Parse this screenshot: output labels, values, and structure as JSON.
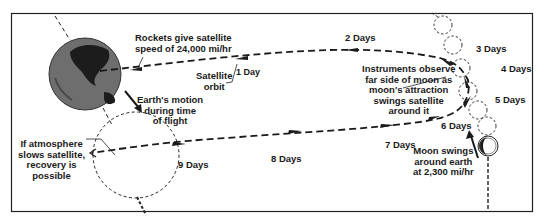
{
  "diagram": {
    "labels": {
      "rockets": [
        "Rockets give satellite",
        "speed of 24,000 mi/hr"
      ],
      "earth_motion": [
        "Earth's motion",
        "during time",
        "of flight"
      ],
      "satellite_orbit": [
        "Satellite",
        "orbit"
      ],
      "instruments": [
        "Instruments observe",
        "far side of moon as",
        "moon's attraction",
        "swings satellite",
        "around it"
      ],
      "atmosphere": [
        "If atmosphere",
        "slows satellite,",
        "recovery is",
        "possible"
      ],
      "moon_swings": [
        "Moon swings",
        "around earth",
        "at 2,300 mi/hr"
      ]
    },
    "days": {
      "d1": "1 Day",
      "d2": "2 Days",
      "d3": "3 Days",
      "d4": "4 Days",
      "d5": "5 Days",
      "d6": "6 Days",
      "d7": "7 Days",
      "d8": "8 Days",
      "d9": "9 Days"
    },
    "colors": {
      "ink": "#1a1a1a",
      "earth": "#6e6e6e",
      "land": "#1c1c1c"
    }
  }
}
